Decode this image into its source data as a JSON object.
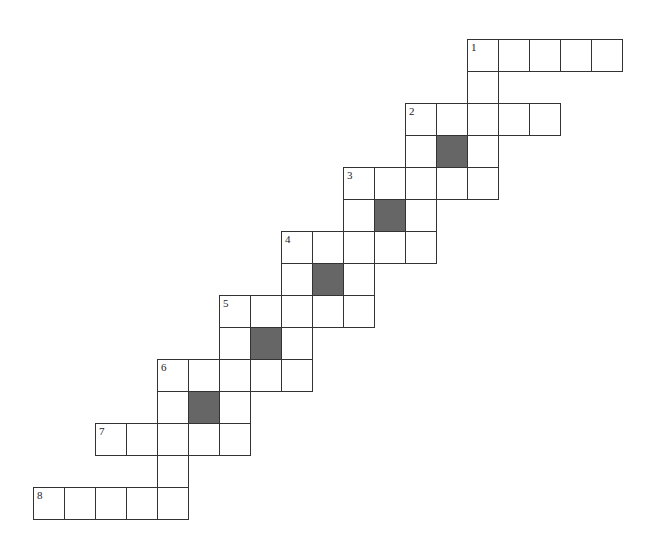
{
  "puzzle": {
    "type": "crossword",
    "cell_width": 31,
    "cell_height": 32,
    "origin_x": 33,
    "origin_y": 39,
    "colors": {
      "block": "#666666",
      "line": "#333333",
      "background": "#ffffff"
    },
    "clue_numbers": [
      "1",
      "2",
      "3",
      "4",
      "5",
      "6",
      "7",
      "8"
    ],
    "cells": [
      {
        "r": 0,
        "c": 14,
        "num": "1"
      },
      {
        "r": 0,
        "c": 15
      },
      {
        "r": 0,
        "c": 16
      },
      {
        "r": 0,
        "c": 17
      },
      {
        "r": 0,
        "c": 18
      },
      {
        "r": 1,
        "c": 14
      },
      {
        "r": 2,
        "c": 12,
        "num": "2"
      },
      {
        "r": 2,
        "c": 13
      },
      {
        "r": 2,
        "c": 14
      },
      {
        "r": 2,
        "c": 15
      },
      {
        "r": 2,
        "c": 16
      },
      {
        "r": 3,
        "c": 12
      },
      {
        "r": 3,
        "c": 13,
        "block": true
      },
      {
        "r": 3,
        "c": 14
      },
      {
        "r": 4,
        "c": 10,
        "num": "3"
      },
      {
        "r": 4,
        "c": 11
      },
      {
        "r": 4,
        "c": 12
      },
      {
        "r": 4,
        "c": 13
      },
      {
        "r": 4,
        "c": 14
      },
      {
        "r": 5,
        "c": 10
      },
      {
        "r": 5,
        "c": 11,
        "block": true
      },
      {
        "r": 5,
        "c": 12
      },
      {
        "r": 6,
        "c": 8,
        "num": "4"
      },
      {
        "r": 6,
        "c": 9
      },
      {
        "r": 6,
        "c": 10
      },
      {
        "r": 6,
        "c": 11
      },
      {
        "r": 6,
        "c": 12
      },
      {
        "r": 7,
        "c": 8
      },
      {
        "r": 7,
        "c": 9,
        "block": true
      },
      {
        "r": 7,
        "c": 10
      },
      {
        "r": 8,
        "c": 6,
        "num": "5"
      },
      {
        "r": 8,
        "c": 7
      },
      {
        "r": 8,
        "c": 8
      },
      {
        "r": 8,
        "c": 9
      },
      {
        "r": 8,
        "c": 10
      },
      {
        "r": 9,
        "c": 6
      },
      {
        "r": 9,
        "c": 7,
        "block": true
      },
      {
        "r": 9,
        "c": 8
      },
      {
        "r": 10,
        "c": 4,
        "num": "6"
      },
      {
        "r": 10,
        "c": 5
      },
      {
        "r": 10,
        "c": 6
      },
      {
        "r": 10,
        "c": 7
      },
      {
        "r": 10,
        "c": 8
      },
      {
        "r": 11,
        "c": 4
      },
      {
        "r": 11,
        "c": 5,
        "block": true
      },
      {
        "r": 11,
        "c": 6
      },
      {
        "r": 12,
        "c": 2,
        "num": "7"
      },
      {
        "r": 12,
        "c": 3
      },
      {
        "r": 12,
        "c": 4
      },
      {
        "r": 12,
        "c": 5
      },
      {
        "r": 12,
        "c": 6
      },
      {
        "r": 13,
        "c": 4
      },
      {
        "r": 14,
        "c": 0,
        "num": "8"
      },
      {
        "r": 14,
        "c": 1
      },
      {
        "r": 14,
        "c": 2
      },
      {
        "r": 14,
        "c": 3
      },
      {
        "r": 14,
        "c": 4
      }
    ]
  }
}
